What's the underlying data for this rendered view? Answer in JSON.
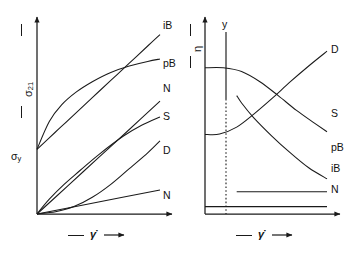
{
  "figure": {
    "kind": "two-panel-rheology-diagram",
    "background": "#ffffff",
    "stroke": "#1a1a1a"
  },
  "left_panel": {
    "name": "flow-curves",
    "y_axis_label": "σ",
    "y_axis_label_sub": "21",
    "x_axis_label": "γ̇",
    "yield_label": "σ",
    "yield_label_sub": "y",
    "curve_labels": [
      "iB",
      "pB",
      "N",
      "S",
      "D",
      "N"
    ]
  },
  "right_panel": {
    "name": "viscosity-curves",
    "y_axis_label": "η",
    "x_axis_label": "γ̇",
    "vertical_marker_label": "y",
    "curve_labels": [
      "D",
      "S",
      "pB",
      "iB",
      "N"
    ]
  },
  "chart_data": [
    {
      "type": "line",
      "title": "Shear stress versus shear rate",
      "xlabel": "γ̇",
      "ylabel": "σ 21",
      "xlim": [
        0,
        1
      ],
      "ylim": [
        0,
        1
      ],
      "grid": false,
      "legend": "inline-right-of-curve-ends",
      "annotations": [
        {
          "text": "σ y",
          "x": 0.0,
          "y": 0.35,
          "note": "yield stress intercept"
        }
      ],
      "series": [
        {
          "name": "iB",
          "label": "iB",
          "note": "ideal Bingham: straight line from yield stress",
          "x": [
            0.0,
            0.15,
            0.3,
            0.45,
            0.6,
            0.75,
            0.9,
            1.0
          ],
          "y": [
            0.35,
            0.443,
            0.536,
            0.629,
            0.722,
            0.815,
            0.908,
            0.97
          ]
        },
        {
          "name": "pB",
          "label": "pB",
          "note": "pseudoplastic Bingham: concave-down from yield stress",
          "x": [
            0.0,
            0.1,
            0.2,
            0.32,
            0.45,
            0.6,
            0.75,
            0.9,
            1.0
          ],
          "y": [
            0.35,
            0.5,
            0.59,
            0.66,
            0.715,
            0.765,
            0.8,
            0.825,
            0.838
          ]
        },
        {
          "name": "N",
          "label": "N",
          "note": "Newtonian (steeper): straight line through origin",
          "x": [
            0.0,
            0.25,
            0.5,
            0.75,
            1.0
          ],
          "y": [
            0.0,
            0.152,
            0.305,
            0.457,
            0.61
          ]
        },
        {
          "name": "S",
          "label": "S",
          "note": "structural/pseudoplastic: concave-down through origin",
          "x": [
            0.0,
            0.1,
            0.22,
            0.35,
            0.5,
            0.7,
            0.85,
            1.0
          ],
          "y": [
            0.0,
            0.08,
            0.16,
            0.235,
            0.32,
            0.42,
            0.48,
            0.525
          ]
        },
        {
          "name": "D",
          "label": "D",
          "note": "dilatant: concave-up through origin",
          "x": [
            0.0,
            0.15,
            0.3,
            0.45,
            0.6,
            0.75,
            0.9,
            1.0
          ],
          "y": [
            0.0,
            0.012,
            0.04,
            0.09,
            0.16,
            0.245,
            0.33,
            0.395
          ]
        },
        {
          "name": "N2",
          "label": "N",
          "note": "Newtonian (low viscosity): straight line through origin",
          "x": [
            0.0,
            0.5,
            1.0
          ],
          "y": [
            0.0,
            0.065,
            0.13
          ]
        }
      ]
    },
    {
      "type": "line",
      "title": "Viscosity versus shear rate",
      "xlabel": "γ̇",
      "ylabel": "η",
      "xlim": [
        0,
        1
      ],
      "ylim": [
        0,
        1
      ],
      "grid": false,
      "legend": "inline-right-of-curve-ends",
      "annotations": [
        {
          "text": "y",
          "x": 0.26,
          "y": 1.0,
          "note": "vertical yield marker dropping to dotted line"
        }
      ],
      "series": [
        {
          "name": "D",
          "label": "D",
          "note": "dilatant: viscosity rises with shear rate",
          "x": [
            0.0,
            0.12,
            0.26,
            0.4,
            0.55,
            0.7,
            0.85,
            1.0
          ],
          "y": [
            0.43,
            0.432,
            0.47,
            0.54,
            0.625,
            0.715,
            0.8,
            0.88
          ]
        },
        {
          "name": "S",
          "label": "S",
          "note": "shear thinning: viscosity falls with shear rate",
          "x": [
            0.0,
            0.15,
            0.3,
            0.45,
            0.6,
            0.75,
            0.9,
            1.0
          ],
          "y": [
            0.79,
            0.79,
            0.77,
            0.715,
            0.64,
            0.56,
            0.49,
            0.445
          ]
        },
        {
          "name": "pB",
          "label": "pB",
          "note": "pseudoplastic Bingham: steep drop at yield then linear decay",
          "x": [
            0.26,
            0.3,
            0.4,
            0.55,
            0.7,
            0.85,
            1.0
          ],
          "y": [
            0.64,
            0.6,
            0.52,
            0.42,
            0.33,
            0.25,
            0.19
          ]
        },
        {
          "name": "iB",
          "label": "iB",
          "note": "ideal Bingham: constant viscosity beyond yield",
          "x": [
            0.26,
            1.0
          ],
          "y": [
            0.12,
            0.12
          ]
        },
        {
          "name": "N",
          "label": "N",
          "note": "Newtonian: constant viscosity at all shear rates",
          "x": [
            0.0,
            1.0
          ],
          "y": [
            0.04,
            0.04
          ]
        }
      ]
    }
  ]
}
